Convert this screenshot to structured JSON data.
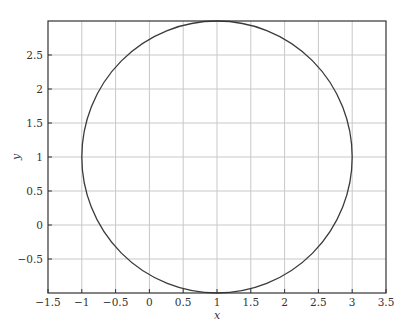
{
  "chart_data": {
    "type": "line",
    "title": "",
    "xlabel": "x",
    "ylabel": "y",
    "xlim": [
      -1.5,
      3.5
    ],
    "ylim": [
      -1.0,
      3.0
    ],
    "grid": true,
    "legend": null,
    "x_ticks": [
      -1.5,
      -1,
      -0.5,
      0,
      0.5,
      1,
      1.5,
      2,
      2.5,
      3,
      3.5
    ],
    "x_tick_labels": [
      "-1.5",
      "-1",
      "-0.5",
      "0",
      "0.5",
      "1",
      "1.5",
      "2",
      "2.5",
      "3",
      "3.5"
    ],
    "y_ticks": [
      -0.5,
      0,
      0.5,
      1,
      1.5,
      2,
      2.5
    ],
    "y_tick_labels": [
      "-0.5",
      "0",
      "0.5",
      "1",
      "1.5",
      "2",
      "2.5"
    ],
    "series": [
      {
        "name": "circle",
        "shape": "circle",
        "center": [
          1,
          1
        ],
        "radius": 2,
        "color": "#3a3a3a",
        "sample_points": {
          "x": [
            3,
            2.732,
            2,
            1,
            0,
            -0.732,
            -1,
            -0.732,
            0,
            1,
            2,
            2.732,
            3
          ],
          "y": [
            1,
            2,
            2.732,
            3,
            2.732,
            2,
            1,
            0,
            -0.732,
            -1,
            -0.732,
            0,
            1
          ]
        }
      }
    ]
  },
  "colors": {
    "curve": "#3a3a3a",
    "grid": "#c8c8c8",
    "axes": "#333333"
  }
}
